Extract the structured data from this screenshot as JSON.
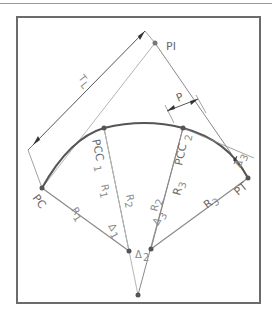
{
  "diagram": {
    "colors": {
      "frame": "#6b6b6b",
      "curve": "#555555",
      "line": "#8a8a8a",
      "light_line": "#b5b5b5",
      "text": "#6a6a6a"
    },
    "points": {
      "PC": {
        "label": "PC",
        "x": 42,
        "y": 188
      },
      "PI": {
        "label": "PI",
        "x": 155,
        "y": 43
      },
      "PT": {
        "label": "PT",
        "x": 248,
        "y": 178
      },
      "PCC1": {
        "label": "PCC",
        "sub": "1",
        "x": 104,
        "y": 128
      },
      "PCC2": {
        "label": "PCC",
        "sub": "2",
        "x": 183,
        "y": 128
      },
      "O1": {
        "x": 129,
        "y": 251
      },
      "O2": {
        "x": 138,
        "y": 295
      },
      "O3": {
        "x": 151,
        "y": 249
      }
    },
    "labels": {
      "TL": "T",
      "TL_sub": "L",
      "P": "P",
      "R1": "R",
      "R1_sub": "1",
      "R2": "R",
      "R2_sub": "2",
      "R3": "R",
      "R3_sub": "3",
      "delta": "Δ",
      "d1_sub": "1",
      "d2_sub": "2",
      "d3_sub": "3"
    }
  }
}
